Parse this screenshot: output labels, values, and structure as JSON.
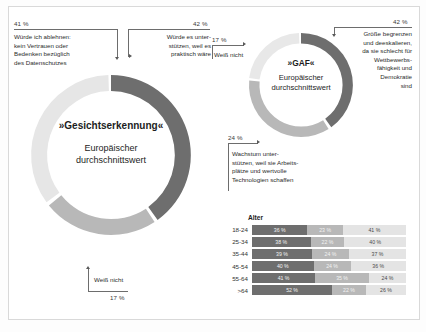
{
  "chart_data": [
    {
      "type": "pie",
      "title": "»Gesichtserkennung«",
      "subtitle": "Europäischer\ndurchschnittswert",
      "legend_position": "callouts",
      "categories": [
        "Würde es unterstützen, weil es praktisch wäre",
        "Weiß nicht",
        "Würde ich ablehnen: kein Vertrauen oder Bedenken bezüglich des Datenschutzes"
      ],
      "values": [
        42,
        17,
        41
      ],
      "value_labels": [
        "42 %",
        "17 %",
        "41 %"
      ],
      "colors": [
        "#6e6e6e",
        "#b8b8b8",
        "#e6e6e6"
      ]
    },
    {
      "type": "pie",
      "title": "»GAF«",
      "subtitle": "Europäischer\ndurchschnittswert",
      "legend_position": "callouts",
      "categories": [
        "Größe begrenzen und deeskalieren, da sie schlecht für Wettbewerbsfähigkeit und Demokratie sind",
        "Wachstum unterstützen, weil sie Arbeitsplätze und wertvolle Technologien schaffen",
        "Weiß nicht"
      ],
      "values": [
        42,
        24,
        17
      ],
      "value_labels": [
        "42 %",
        "24 %",
        "17 %"
      ],
      "colors": [
        "#6e6e6e",
        "#b8b8b8",
        "#e8e8e8"
      ]
    },
    {
      "type": "bar",
      "title": "Alter",
      "orientation": "horizontal",
      "stacked": true,
      "categories": [
        "18-24",
        "25-34",
        "35-44",
        "45-54",
        "55-64",
        ">64"
      ],
      "series": [
        {
          "name": "Würde es unterstützen",
          "values": [
            36,
            38,
            39,
            40,
            41,
            52
          ]
        },
        {
          "name": "Weiß nicht",
          "values": [
            23,
            22,
            24,
            24,
            35,
            22
          ]
        },
        {
          "name": "Würde ich ablehnen",
          "values": [
            41,
            40,
            37,
            36,
            24,
            26
          ]
        }
      ],
      "xlim": [
        0,
        100
      ],
      "grid": false
    }
  ],
  "donut_left": {
    "title": "»Gesichtserkennung«",
    "subtitle": "Europäischer\ndurchschnittswert",
    "callout_support": {
      "pct": "42 %",
      "text": "Würde es unter-\nstützen, weil es\npraktisch wäre"
    },
    "callout_reject": {
      "pct": "41 %",
      "text": "Würde ich ablehnen:\nkein Vertrauen oder\nBedenken bezüglich\ndes Datenschutzes"
    },
    "callout_unknown": {
      "pct": "17 %",
      "text": "Weiß nicht"
    }
  },
  "donut_right": {
    "title": "»GAF«",
    "subtitle": "Europäischer\ndurchschnittswert",
    "callout_limit": {
      "pct": "42 %",
      "text": "Größe begrenzen\nund deeskalieren,\nda sie schlecht für\nWettbewerbs-\nfähigkeit und\nDemokratie\nsind"
    },
    "callout_growth": {
      "pct": "24 %",
      "text": "Wachstum unter-\nstützen, weil sie Arbeits-\nplätze und wertvolle\nTechnologien schaffen"
    },
    "callout_unknown": {
      "pct": "17 %",
      "text": "Weiß nicht"
    }
  },
  "bars": {
    "title": "Alter",
    "rows": [
      {
        "label": "18-24",
        "s1": "36 %",
        "s2": "23 %",
        "s3": "41 %",
        "v1": 36,
        "v2": 23,
        "v3": 41
      },
      {
        "label": "25-34",
        "s1": "38 %",
        "s2": "22 %",
        "s3": "40 %",
        "v1": 38,
        "v2": 22,
        "v3": 40
      },
      {
        "label": "35-44",
        "s1": "39 %",
        "s2": "24 %",
        "s3": "37 %",
        "v1": 39,
        "v2": 24,
        "v3": 37
      },
      {
        "label": "45-54",
        "s1": "40 %",
        "s2": "24 %",
        "s3": "36 %",
        "v1": 40,
        "v2": 24,
        "v3": 36
      },
      {
        "label": "55-64",
        "s1": "41 %",
        "s2": "35 %",
        "s3": "24 %",
        "v1": 41,
        "v2": 35,
        "v3": 24
      },
      {
        "label": ">64",
        "s1": "52 %",
        "s2": "22 %",
        "s3": "26 %",
        "v1": 52,
        "v2": 22,
        "v3": 26
      }
    ]
  },
  "colors": {
    "dark": "#6e6e6e",
    "mid": "#b8b8b8",
    "light": "#e6e6e6",
    "bar_light": "#e4e4e4",
    "text": "#231f20"
  }
}
